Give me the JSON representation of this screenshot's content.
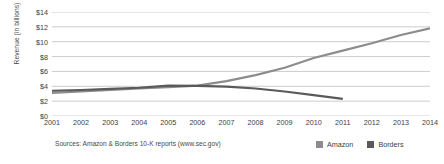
{
  "chart_data": {
    "type": "line",
    "title": "",
    "xlabel": "",
    "ylabel": "Revenue (in billions)",
    "x": [
      2001,
      2002,
      2003,
      2004,
      2005,
      2006,
      2007,
      2008,
      2009,
      2010,
      2011,
      2012,
      2013,
      2014
    ],
    "categories": [
      "2001",
      "2002",
      "2003",
      "2004",
      "2005",
      "2006",
      "2007",
      "2008",
      "2009",
      "2010",
      "2011",
      "2012",
      "2013",
      "2014"
    ],
    "xlim": [
      2001,
      2014
    ],
    "ylim": [
      0,
      14
    ],
    "ytick_values": [
      0,
      2,
      4,
      6,
      8,
      10,
      12,
      14
    ],
    "ytick_labels": [
      "$0",
      "$2",
      "$4",
      "$6",
      "$8",
      "$10",
      "$12",
      "$14"
    ],
    "grid": "horizontal",
    "legend_position": "bottom-right",
    "series": [
      {
        "name": "Amazon",
        "color": "#8c8c8c",
        "values": [
          3.1,
          3.3,
          3.5,
          3.7,
          3.9,
          4.1,
          4.7,
          5.5,
          6.5,
          7.8,
          8.8,
          9.8,
          10.9,
          11.8
        ]
      },
      {
        "name": "Borders",
        "color": "#5a5a5a",
        "values": [
          3.4,
          3.5,
          3.65,
          3.8,
          4.1,
          4.05,
          3.95,
          3.7,
          3.3,
          2.8,
          2.3,
          null,
          null,
          null
        ]
      }
    ],
    "source_note": "Sources: Amazon & Borders 10-K reports (www.sec.gov)",
    "gridline_color": "#bfbfbf",
    "text_color": "#3d3d3d",
    "background_color": "#ffffff"
  }
}
